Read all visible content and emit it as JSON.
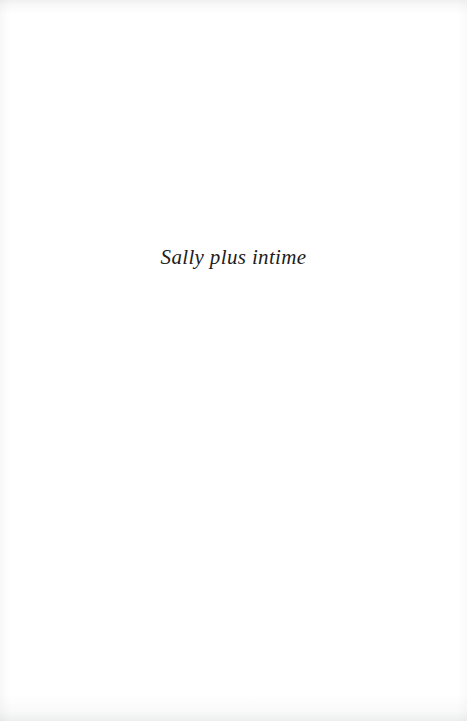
{
  "page": {
    "kind": "scanned-book-page",
    "page_background_color": "#ffffff",
    "ink_color": "#1d1c1e",
    "body": {
      "section_title": "Sally plus intime"
    },
    "artifacts": {
      "top_edge_label": "scan-shadow-top",
      "bottom_edge_label": "scan-shadow-bottom",
      "left_edge_label": "scan-shadow-left",
      "right_edge_label": "scan-shadow-right"
    }
  }
}
